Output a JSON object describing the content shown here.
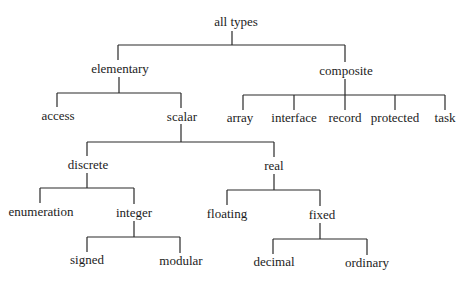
{
  "diagram": {
    "type": "tree",
    "nodes": {
      "root": {
        "label": "all types",
        "x": 236,
        "y": 24
      },
      "elementary": {
        "label": "elementary",
        "x": 120,
        "y": 72
      },
      "composite": {
        "label": "composite",
        "x": 346,
        "y": 74
      },
      "access": {
        "label": "access",
        "x": 58,
        "y": 119
      },
      "scalar": {
        "label": "scalar",
        "x": 182,
        "y": 120
      },
      "array": {
        "label": "array",
        "x": 243,
        "y": 121
      },
      "interface": {
        "label": "interface",
        "x": 294,
        "y": 121
      },
      "record": {
        "label": "record",
        "x": 345,
        "y": 121
      },
      "protected": {
        "label": "protected",
        "x": 395,
        "y": 121
      },
      "task": {
        "label": "task",
        "x": 445,
        "y": 121
      },
      "discrete": {
        "label": "discrete",
        "x": 88,
        "y": 168
      },
      "real": {
        "label": "real",
        "x": 274,
        "y": 169
      },
      "enumeration": {
        "label": "enumeration",
        "x": 41,
        "y": 215
      },
      "integer": {
        "label": "integer",
        "x": 134,
        "y": 216
      },
      "floating": {
        "label": "floating",
        "x": 227,
        "y": 217
      },
      "fixed": {
        "label": "fixed",
        "x": 322,
        "y": 218
      },
      "signed": {
        "label": "signed",
        "x": 87,
        "y": 263
      },
      "modular": {
        "label": "modular",
        "x": 181,
        "y": 264
      },
      "decimal": {
        "label": "decimal",
        "x": 274,
        "y": 265
      },
      "ordinary": {
        "label": "ordinary",
        "x": 367,
        "y": 266
      }
    },
    "edges": [
      [
        "root",
        "elementary"
      ],
      [
        "root",
        "composite"
      ],
      [
        "elementary",
        "access"
      ],
      [
        "elementary",
        "scalar"
      ],
      [
        "composite",
        "array"
      ],
      [
        "composite",
        "interface"
      ],
      [
        "composite",
        "record"
      ],
      [
        "composite",
        "protected"
      ],
      [
        "composite",
        "task"
      ],
      [
        "scalar",
        "discrete"
      ],
      [
        "scalar",
        "real"
      ],
      [
        "discrete",
        "enumeration"
      ],
      [
        "discrete",
        "integer"
      ],
      [
        "integer",
        "signed"
      ],
      [
        "integer",
        "modular"
      ],
      [
        "real",
        "floating"
      ],
      [
        "real",
        "fixed"
      ],
      [
        "fixed",
        "decimal"
      ],
      [
        "fixed",
        "ordinary"
      ]
    ]
  }
}
